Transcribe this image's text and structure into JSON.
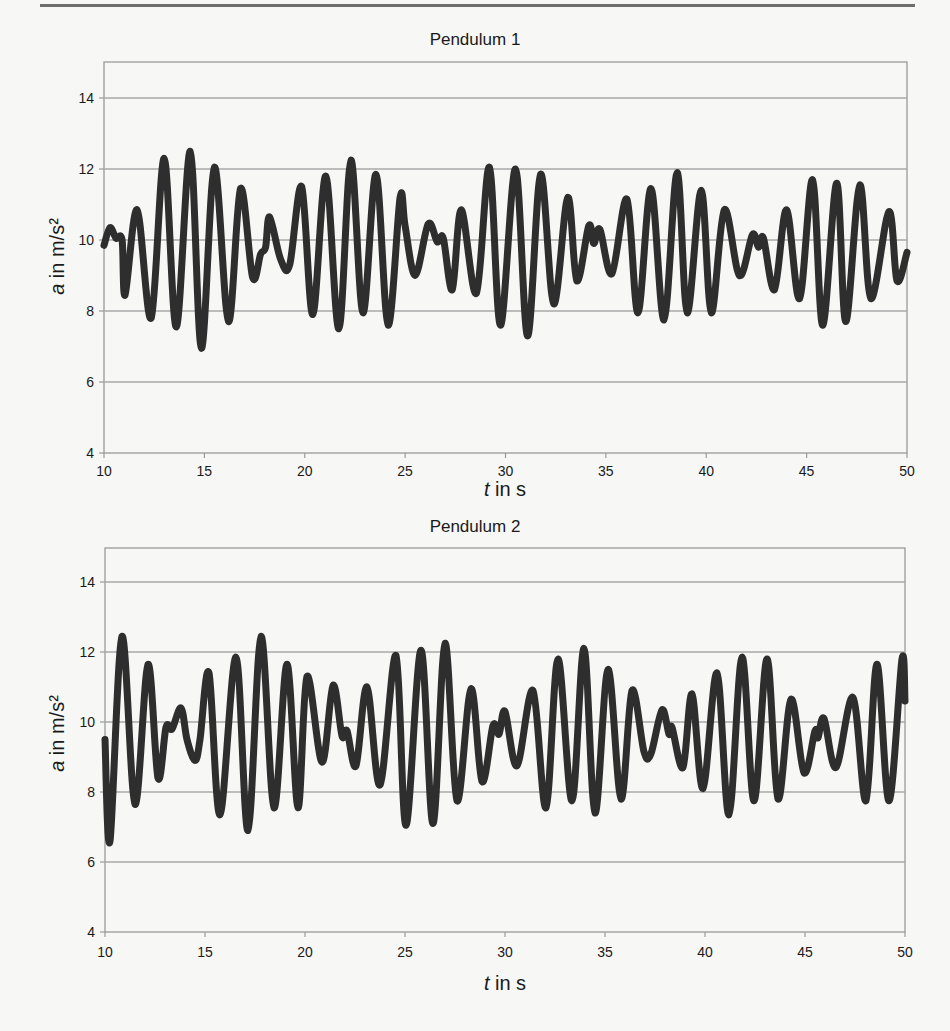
{
  "page": {
    "rule": true
  },
  "chart_data": [
    {
      "type": "line",
      "title": "Pendulum 1",
      "xlabel_var": "t",
      "xlabel_rest": " in s",
      "ylabel_var": "a",
      "ylabel_rest": " in m/s²",
      "xlim": [
        10,
        50
      ],
      "ylim": [
        4,
        15
      ],
      "xticks": [
        10,
        15,
        20,
        25,
        30,
        35,
        40,
        45,
        50
      ],
      "yticks": [
        4,
        6,
        8,
        10,
        12,
        14
      ],
      "grid": "horizontal",
      "line_color": "#2e2e2e",
      "series": [
        {
          "name": "Pendulum 1",
          "t": [
            10.0,
            10.3,
            10.6,
            10.9,
            11.05,
            11.65,
            12.35,
            13.0,
            13.6,
            14.3,
            14.85,
            15.5,
            16.2,
            16.8,
            17.4,
            17.8,
            18.05,
            18.25,
            18.8,
            19.25,
            19.85,
            20.4,
            21.05,
            21.7,
            22.3,
            22.9,
            23.55,
            24.15,
            24.75,
            25.0,
            25.5,
            26.15,
            26.6,
            26.9,
            27.35,
            27.8,
            28.55,
            29.2,
            29.75,
            30.5,
            31.1,
            31.75,
            32.4,
            33.1,
            33.55,
            34.15,
            34.4,
            34.7,
            35.3,
            36.05,
            36.6,
            37.25,
            37.9,
            38.55,
            39.05,
            39.75,
            40.25,
            40.9,
            41.65,
            42.3,
            42.6,
            42.85,
            43.4,
            44.0,
            44.65,
            45.3,
            45.8,
            46.5,
            46.95,
            47.65,
            48.2,
            49.1,
            49.5,
            50.0
          ],
          "a": [
            9.85,
            10.35,
            10.05,
            10.0,
            8.45,
            10.85,
            7.8,
            12.3,
            7.55,
            12.5,
            6.95,
            12.05,
            7.7,
            11.45,
            8.95,
            9.6,
            9.8,
            10.65,
            9.45,
            9.3,
            11.5,
            7.9,
            11.8,
            7.5,
            12.25,
            7.95,
            11.85,
            7.6,
            11.2,
            10.4,
            9.0,
            10.45,
            9.95,
            10.05,
            8.6,
            10.85,
            8.5,
            12.05,
            7.6,
            12.0,
            7.3,
            11.85,
            8.2,
            11.2,
            8.85,
            10.4,
            9.9,
            10.3,
            9.05,
            11.15,
            7.95,
            11.45,
            7.75,
            11.9,
            7.95,
            11.4,
            7.95,
            10.85,
            9.0,
            10.15,
            9.8,
            10.05,
            8.6,
            10.85,
            8.35,
            11.7,
            7.6,
            11.6,
            7.7,
            11.55,
            8.35,
            10.8,
            8.85,
            9.65
          ]
        }
      ]
    },
    {
      "type": "line",
      "title": "Pendulum 2",
      "xlabel_var": "t",
      "xlabel_rest": " in s",
      "ylabel_var": "a",
      "ylabel_rest": " in m/s²",
      "xlim": [
        10,
        50
      ],
      "ylim": [
        4,
        15
      ],
      "xticks": [
        10,
        15,
        20,
        25,
        30,
        35,
        40,
        45,
        50
      ],
      "yticks": [
        4,
        6,
        8,
        10,
        12,
        14
      ],
      "grid": "horizontal",
      "line_color": "#2e2e2e",
      "series": [
        {
          "name": "Pendulum 2",
          "t": [
            10.0,
            10.25,
            10.85,
            11.5,
            12.15,
            12.65,
            13.05,
            13.35,
            13.8,
            14.1,
            14.5,
            14.75,
            15.2,
            15.75,
            16.55,
            17.15,
            17.8,
            18.45,
            19.1,
            19.65,
            20.1,
            20.85,
            21.4,
            21.85,
            22.1,
            22.55,
            23.1,
            23.75,
            24.55,
            25.05,
            25.8,
            26.4,
            27.0,
            27.6,
            28.3,
            28.85,
            29.4,
            29.7,
            30.0,
            30.6,
            31.4,
            32.05,
            32.65,
            33.35,
            33.95,
            34.5,
            35.15,
            35.8,
            36.35,
            36.95,
            37.3,
            37.85,
            38.2,
            38.35,
            38.9,
            39.35,
            39.9,
            40.6,
            41.2,
            41.85,
            42.45,
            43.1,
            43.65,
            44.3,
            44.95,
            45.5,
            45.65,
            45.95,
            46.55,
            47.4,
            48.05,
            48.6,
            49.2,
            49.85,
            50.0
          ],
          "a": [
            9.5,
            6.6,
            12.45,
            7.65,
            11.65,
            8.4,
            9.85,
            9.8,
            10.4,
            9.5,
            8.9,
            9.5,
            11.4,
            7.35,
            11.85,
            6.9,
            12.45,
            7.55,
            11.65,
            7.55,
            11.3,
            8.85,
            11.05,
            9.6,
            9.75,
            8.75,
            11.0,
            8.2,
            11.9,
            7.05,
            12.05,
            7.1,
            12.25,
            7.75,
            10.95,
            8.3,
            9.9,
            9.65,
            10.3,
            8.75,
            10.9,
            7.55,
            11.8,
            7.75,
            12.1,
            7.4,
            11.5,
            7.8,
            10.9,
            9.15,
            9.1,
            10.35,
            9.65,
            9.85,
            8.7,
            10.8,
            8.1,
            11.4,
            7.35,
            11.85,
            7.75,
            11.8,
            7.8,
            10.65,
            8.55,
            9.75,
            9.55,
            10.1,
            8.7,
            10.7,
            7.75,
            11.65,
            7.75,
            11.8,
            10.6
          ]
        }
      ]
    }
  ],
  "charts": [
    {
      "title": "Pendulum 1",
      "xlabel_var": "t",
      "xlabel_rest": " in s",
      "ylabel_var": "a",
      "ylabel_rest": " in m/s²"
    },
    {
      "title": "Pendulum 2",
      "xlabel_var": "t",
      "xlabel_rest": " in s",
      "ylabel_var": "a",
      "ylabel_rest": " in m/s²"
    }
  ]
}
